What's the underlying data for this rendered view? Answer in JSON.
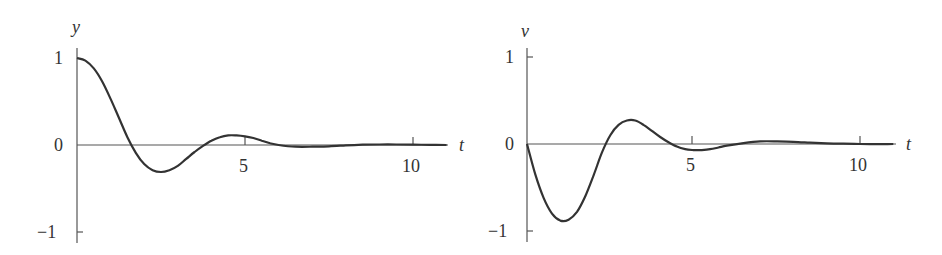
{
  "chart_data": [
    {
      "type": "line",
      "title": "",
      "xlabel": "t",
      "ylabel": "y",
      "xlim": [
        0,
        11
      ],
      "ylim": [
        -1,
        1
      ],
      "xticks": [
        5,
        10
      ],
      "yticks": [
        -1,
        0,
        1
      ],
      "grid": false,
      "series": [
        {
          "name": "y",
          "x": [
            0,
            0.25,
            0.5,
            0.75,
            1,
            1.25,
            1.5,
            1.75,
            2,
            2.25,
            2.5,
            2.75,
            3,
            3.25,
            3.5,
            3.75,
            4,
            4.25,
            4.5,
            4.75,
            5,
            5.25,
            5.5,
            5.75,
            6,
            6.5,
            7,
            7.5,
            8,
            8.5,
            9,
            9.5,
            10,
            10.5,
            11
          ],
          "values": [
            1,
            0.97,
            0.88,
            0.73,
            0.53,
            0.31,
            0.09,
            -0.09,
            -0.22,
            -0.29,
            -0.31,
            -0.29,
            -0.24,
            -0.16,
            -0.08,
            -0.01,
            0.05,
            0.09,
            0.11,
            0.11,
            0.1,
            0.08,
            0.05,
            0.02,
            0.0,
            -0.02,
            -0.02,
            -0.015,
            -0.005,
            0.003,
            0.006,
            0.006,
            0.004,
            0.002,
            0.0
          ]
        }
      ]
    },
    {
      "type": "line",
      "title": "",
      "xlabel": "t",
      "ylabel": "v",
      "xlim": [
        0,
        11
      ],
      "ylim": [
        -1,
        1
      ],
      "xticks": [
        5,
        10
      ],
      "yticks": [
        -1,
        0,
        1
      ],
      "grid": false,
      "series": [
        {
          "name": "v",
          "x": [
            0,
            0.25,
            0.5,
            0.75,
            1,
            1.25,
            1.5,
            1.75,
            2,
            2.25,
            2.5,
            2.75,
            3,
            3.25,
            3.5,
            3.75,
            4,
            4.25,
            4.5,
            4.75,
            5,
            5.25,
            5.5,
            5.75,
            6,
            6.5,
            7,
            7.5,
            8,
            8.5,
            9,
            9.5,
            10,
            10.5,
            11
          ],
          "values": [
            0,
            -0.35,
            -0.62,
            -0.8,
            -0.88,
            -0.87,
            -0.78,
            -0.6,
            -0.36,
            -0.1,
            0.1,
            0.22,
            0.27,
            0.27,
            0.22,
            0.15,
            0.08,
            0.02,
            -0.03,
            -0.06,
            -0.07,
            -0.07,
            -0.06,
            -0.04,
            -0.02,
            0.01,
            0.03,
            0.03,
            0.025,
            0.015,
            0.008,
            0.003,
            0.0,
            -0.002,
            0.0
          ]
        }
      ]
    }
  ],
  "charts": [
    {
      "ylabel": "y",
      "xlabel": "t",
      "ytick_labels": [
        "1",
        "0",
        "−1"
      ],
      "xtick_labels": [
        "5",
        "10"
      ]
    },
    {
      "ylabel": "v",
      "xlabel": "t",
      "ytick_labels": [
        "1",
        "0",
        "−1"
      ],
      "xtick_labels": [
        "5",
        "10"
      ]
    }
  ]
}
